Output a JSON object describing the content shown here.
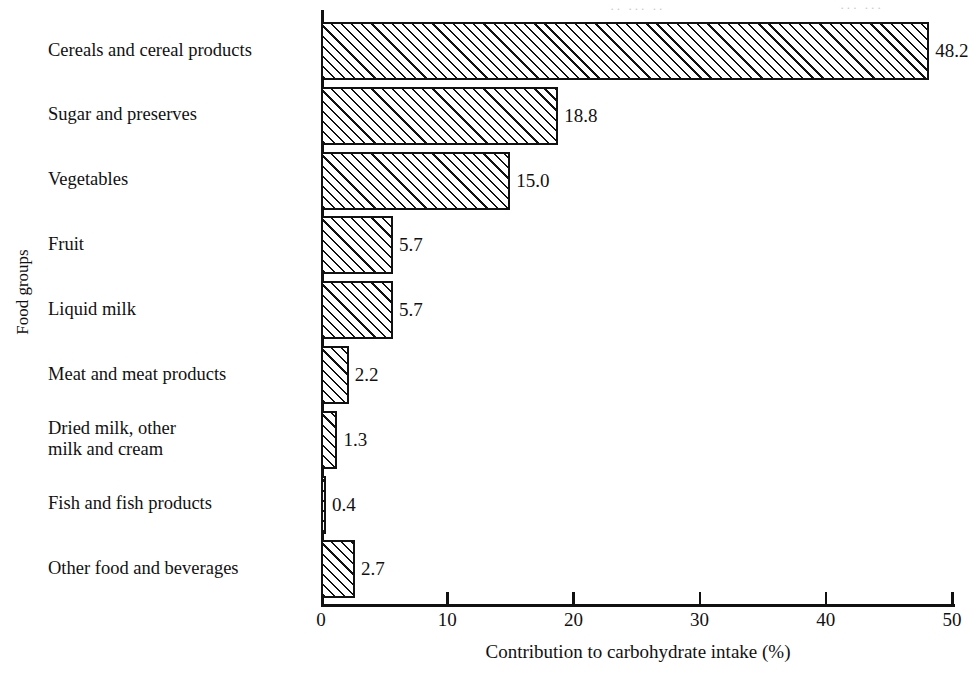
{
  "chart_data": {
    "type": "bar",
    "orientation": "horizontal",
    "title": "",
    "xlabel": "Contribution to carbohydrate intake (%)",
    "ylabel": "Food groups",
    "xlim": [
      0,
      50
    ],
    "xticks": [
      0,
      10,
      20,
      30,
      40,
      50
    ],
    "xtick_labels": [
      "0",
      "10",
      "20",
      "30",
      "40",
      "50"
    ],
    "grid": false,
    "legend": "none",
    "bar_style": "diagonal-hatch-45deg-black-on-white",
    "categories": [
      "Cereals and cereal products",
      "Sugar and preserves",
      "Vegetables",
      "Fruit",
      "Liquid milk",
      "Meat and meat products",
      "Dried milk, other\nmilk and cream",
      "Fish and fish products",
      "Other food and beverages"
    ],
    "values": [
      48.2,
      18.8,
      15.0,
      5.7,
      5.7,
      2.2,
      1.3,
      0.4,
      2.7
    ],
    "value_labels": [
      "48.2",
      "18.8",
      "15.0",
      "5.7",
      "5.7",
      "2.2",
      "1.3",
      "0.4",
      "2.7"
    ]
  },
  "colors": {
    "ink": "#111111",
    "paper": "#ffffff",
    "bleed_through": "#c9c9c9"
  },
  "artifacts": {
    "bleed_top_left": "·· ··· ··",
    "bleed_top_right": "··· ···"
  }
}
